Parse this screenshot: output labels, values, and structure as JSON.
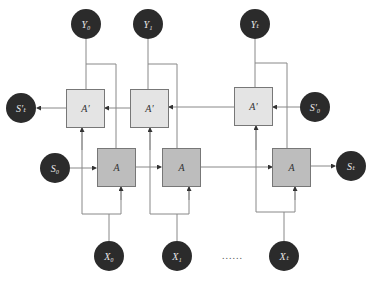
{
  "diagram": {
    "outputs": [
      {
        "label": "Y₀"
      },
      {
        "label": "Y₁"
      },
      {
        "label": "Yₜ"
      }
    ],
    "inputs": [
      {
        "label": "X₀"
      },
      {
        "label": "X₁"
      },
      {
        "label": "Xₜ"
      }
    ],
    "forward_cells": [
      {
        "label": "A"
      },
      {
        "label": "A"
      },
      {
        "label": "A"
      }
    ],
    "backward_cells": [
      {
        "label": "A′"
      },
      {
        "label": "A′"
      },
      {
        "label": "A′"
      }
    ],
    "states": {
      "s0": "S₀",
      "st": "Sₜ",
      "s0_prime": "S′₀",
      "st_prime": "S′ₜ"
    },
    "ellipsis": "......",
    "colors": {
      "node": "#2b2b2b",
      "forward_cell": "#bdbdbd",
      "backward_cell": "#e4e4e4",
      "line": "#777777"
    }
  }
}
